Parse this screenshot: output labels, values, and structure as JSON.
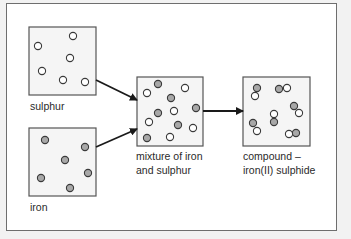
{
  "diagram": {
    "title": "",
    "colors": {
      "box_fill": "#f5f5f5",
      "box_border": "#555555",
      "sulphur_particle": "#ffffff",
      "iron_particle": "#a8a8a8",
      "particle_stroke": "#3a3a3a",
      "arrow": "#1a1a1a"
    },
    "boxes": [
      {
        "id": "sulphur",
        "label_lines": [
          "sulphur"
        ],
        "x": 29,
        "y": 27,
        "w": 67,
        "h": 68,
        "particles": [
          {
            "type": "S",
            "x": 73,
            "y": 36
          },
          {
            "type": "S",
            "x": 38,
            "y": 46
          },
          {
            "type": "S",
            "x": 70,
            "y": 58
          },
          {
            "type": "S",
            "x": 42,
            "y": 71
          },
          {
            "type": "S",
            "x": 63,
            "y": 80
          },
          {
            "type": "S",
            "x": 85,
            "y": 82
          }
        ]
      },
      {
        "id": "iron",
        "label_lines": [
          "iron"
        ],
        "x": 29,
        "y": 128,
        "w": 67,
        "h": 68,
        "particles": [
          {
            "type": "Fe",
            "x": 45,
            "y": 140
          },
          {
            "type": "Fe",
            "x": 85,
            "y": 147
          },
          {
            "type": "Fe",
            "x": 65,
            "y": 160
          },
          {
            "type": "Fe",
            "x": 88,
            "y": 173
          },
          {
            "type": "Fe",
            "x": 41,
            "y": 178
          },
          {
            "type": "Fe",
            "x": 70,
            "y": 188
          }
        ]
      },
      {
        "id": "mixture",
        "label_lines": [
          "mixture of iron",
          "and sulphur"
        ],
        "x": 137,
        "y": 77,
        "w": 66,
        "h": 69,
        "particles": [
          {
            "type": "Fe",
            "x": 158,
            "y": 84
          },
          {
            "type": "S",
            "x": 147,
            "y": 93
          },
          {
            "type": "S",
            "x": 185,
            "y": 88
          },
          {
            "type": "Fe",
            "x": 171,
            "y": 98
          },
          {
            "type": "Fe",
            "x": 196,
            "y": 108
          },
          {
            "type": "S",
            "x": 174,
            "y": 111
          },
          {
            "type": "Fe",
            "x": 158,
            "y": 113
          },
          {
            "type": "S",
            "x": 149,
            "y": 122
          },
          {
            "type": "Fe",
            "x": 178,
            "y": 125
          },
          {
            "type": "S",
            "x": 193,
            "y": 128
          },
          {
            "type": "Fe",
            "x": 147,
            "y": 138
          },
          {
            "type": "S",
            "x": 170,
            "y": 137
          }
        ]
      },
      {
        "id": "compound",
        "label_lines": [
          "compound –",
          "iron(II) sulphide"
        ],
        "x": 243,
        "y": 77,
        "w": 67,
        "h": 69,
        "particles": [
          {
            "type": "Fe",
            "x": 257,
            "y": 88
          },
          {
            "type": "S",
            "x": 255,
            "y": 96
          },
          {
            "type": "Fe",
            "x": 279,
            "y": 89
          },
          {
            "type": "S",
            "x": 287,
            "y": 88
          },
          {
            "type": "Fe",
            "x": 294,
            "y": 106
          },
          {
            "type": "S",
            "x": 299,
            "y": 113
          },
          {
            "type": "S",
            "x": 274,
            "y": 114
          },
          {
            "type": "Fe",
            "x": 274,
            "y": 122
          },
          {
            "type": "Fe",
            "x": 253,
            "y": 123
          },
          {
            "type": "S",
            "x": 257,
            "y": 131
          },
          {
            "type": "S",
            "x": 289,
            "y": 134
          },
          {
            "type": "Fe",
            "x": 296,
            "y": 133
          }
        ]
      }
    ],
    "arrows": [
      {
        "id": "sulphur-to-mixture",
        "x1": 96,
        "y1": 80,
        "x2": 137,
        "y2": 100
      },
      {
        "id": "iron-to-mixture",
        "x1": 96,
        "y1": 147,
        "x2": 137,
        "y2": 129
      },
      {
        "id": "mixture-to-compound",
        "x1": 203,
        "y1": 111,
        "x2": 243,
        "y2": 111
      }
    ],
    "labels": [
      {
        "id": "sulphur",
        "x": 30,
        "y": 99,
        "lines": [
          "sulphur"
        ]
      },
      {
        "id": "iron",
        "x": 30,
        "y": 200,
        "lines": [
          "iron"
        ]
      },
      {
        "id": "mixture",
        "x": 136,
        "y": 149,
        "lines": [
          "mixture of iron",
          "and sulphur"
        ]
      },
      {
        "id": "compound",
        "x": 243,
        "y": 149,
        "lines": [
          "compound –",
          "iron(II) sulphide"
        ]
      }
    ]
  }
}
